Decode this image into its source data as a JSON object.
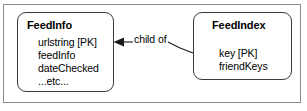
{
  "diagram": {
    "type": "entity-relationship-diagram",
    "entities": [
      {
        "id": "feedinfo",
        "title": "FeedInfo",
        "attributes": [
          "urlstring [PK]",
          "feedInfo",
          "dateChecked",
          "...etc..."
        ]
      },
      {
        "id": "feedindex",
        "title": "FeedIndex",
        "attributes": [
          "key [PK]",
          "friendKeys"
        ]
      }
    ],
    "relationship": {
      "label": "child of",
      "from": "feedindex",
      "to": "feedinfo",
      "arrow": "solid-triangle-arrowhead"
    },
    "colors": {
      "background": "#ffffff",
      "frame_border": "#8a8a8a",
      "box_border": "#3a3a3a",
      "text": "#000000",
      "connector": "#1a1a1a"
    }
  }
}
